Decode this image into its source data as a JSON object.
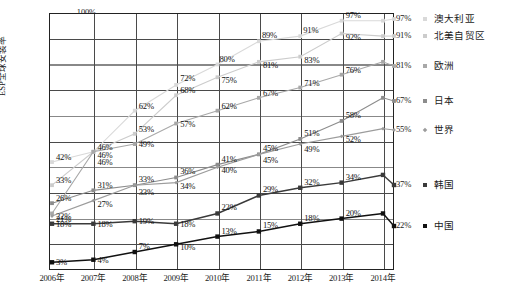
{
  "chart_data": {
    "type": "line",
    "title": "",
    "xlabel": "",
    "ylabel": "ESP全球安装率",
    "ylim": [
      0,
      100
    ],
    "ytick_labels": [
      "100%",
      "80%",
      "60%",
      "40%",
      "20%"
    ],
    "ytick_values": [
      100,
      80,
      60,
      40,
      20
    ],
    "grid": true,
    "grid_interval": 10,
    "legend_position": "right",
    "categories": [
      "2006年",
      "2007年",
      "2008年",
      "2009年",
      "2010年",
      "2011年",
      "2012年",
      "2013年",
      "2014年"
    ],
    "x": [
      2006,
      2007,
      2008,
      2009,
      2010,
      2011,
      2012,
      2013,
      2014
    ],
    "series": [
      {
        "name": "澳大利亚",
        "end_label": "97%",
        "color": "#d9d9d9",
        "marker": "square",
        "values": [
          42,
          46,
          62,
          72,
          80,
          89,
          91,
          97,
          97
        ],
        "labels": [
          "42%",
          "46%",
          "62%",
          "72%",
          "80%",
          "89%",
          "91%",
          "97%",
          ""
        ]
      },
      {
        "name": "北美自贸区",
        "end_label": "91%",
        "color": "#cccccc",
        "marker": "square",
        "values": [
          33,
          46,
          53,
          68,
          75,
          81,
          83,
          92,
          91
        ],
        "labels": [
          "33%",
          "46%",
          "53%",
          "68%",
          "75%",
          "81%",
          "83%",
          "92%",
          ""
        ]
      },
      {
        "name": "欧洲",
        "end_label": "81%",
        "color": "#a8a8a8",
        "marker": "square",
        "values": [
          22,
          46,
          49,
          57,
          62,
          67,
          71,
          76,
          81
        ],
        "labels": [
          "22%",
          "46%",
          "49%",
          "57%",
          "62%",
          "67%",
          "71%",
          "76%",
          ""
        ]
      },
      {
        "name": "日本",
        "end_label": "67%",
        "color": "#8c8c8c",
        "marker": "square",
        "values": [
          26,
          31,
          33,
          36,
          41,
          45,
          51,
          58,
          67
        ],
        "labels": [
          "26%",
          "31%",
          "33%",
          "36%",
          "41%",
          "45%",
          "51%",
          "58%",
          ""
        ]
      },
      {
        "name": "世界",
        "end_label": "55%",
        "color": "#9c9c9c",
        "marker": "diamond",
        "values": [
          21,
          27,
          33,
          34,
          40,
          45,
          49,
          52,
          55
        ],
        "labels": [
          "21%",
          "27%",
          "33%",
          "34%",
          "40%",
          "45%",
          "49%",
          "52%",
          ""
        ]
      },
      {
        "name": "韩国",
        "end_label": "37%",
        "color": "#3a3a3a",
        "marker": "square",
        "values": [
          18,
          18,
          19,
          18,
          22,
          29,
          32,
          34,
          37
        ],
        "labels": [
          "18%",
          "18%",
          "19%",
          "18%",
          "22%",
          "29%",
          "32%",
          "34%",
          ""
        ]
      },
      {
        "name": "中国",
        "end_label": "22%",
        "color": "#111111",
        "marker": "square",
        "values": [
          3,
          4,
          7,
          10,
          13,
          15,
          18,
          20,
          22
        ],
        "labels": [
          "3%",
          "4%",
          "7%",
          "10%",
          "13%",
          "15%",
          "18%",
          "20%",
          ""
        ]
      }
    ]
  }
}
